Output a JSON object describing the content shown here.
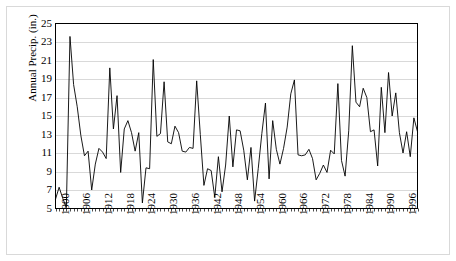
{
  "chart_data": {
    "type": "line",
    "title": "",
    "xlabel": "",
    "ylabel": "Annual Precip. (in.)",
    "ylim": [
      5,
      25
    ],
    "ytick_step": 2,
    "yticks": [
      5,
      7,
      9,
      11,
      13,
      15,
      17,
      19,
      21,
      23,
      25
    ],
    "xlim": [
      1900,
      2000
    ],
    "xticks": [
      1900,
      1906,
      1912,
      1918,
      1924,
      1930,
      1936,
      1942,
      1948,
      1954,
      1960,
      1966,
      1972,
      1978,
      1984,
      1990,
      1996
    ],
    "xtick_labels": [
      "1900",
      "1906",
      "1912",
      "1918",
      "1924",
      "1930",
      "1936",
      "1942",
      "1948",
      "1954",
      "1960",
      "1966",
      "1972",
      "1978",
      "1984",
      "1990",
      "1996"
    ],
    "xtick_rotation": 90,
    "grid": "horizontal",
    "legend": "none",
    "line_color": "#000000",
    "grid_color": "#c8c8c8",
    "axis_color": "#000000",
    "background_color": "#ffffff",
    "x": [
      1900,
      1901,
      1902,
      1903,
      1904,
      1905,
      1906,
      1907,
      1908,
      1909,
      1910,
      1911,
      1912,
      1913,
      1914,
      1915,
      1916,
      1917,
      1918,
      1919,
      1920,
      1921,
      1922,
      1923,
      1924,
      1925,
      1926,
      1927,
      1928,
      1929,
      1930,
      1931,
      1932,
      1933,
      1934,
      1935,
      1936,
      1937,
      1938,
      1939,
      1940,
      1941,
      1942,
      1943,
      1944,
      1945,
      1946,
      1947,
      1948,
      1949,
      1950,
      1951,
      1952,
      1953,
      1954,
      1955,
      1956,
      1957,
      1958,
      1959,
      1960,
      1961,
      1962,
      1963,
      1964,
      1965,
      1966,
      1967,
      1968,
      1969,
      1970,
      1971,
      1972,
      1973,
      1974,
      1975,
      1976,
      1977,
      1978,
      1979,
      1980,
      1981,
      1982,
      1983,
      1984,
      1985,
      1986,
      1987,
      1988,
      1989,
      1990,
      1991,
      1992,
      1993,
      1994,
      1995,
      1996,
      1997,
      1998,
      1999,
      2000
    ],
    "values": [
      6.0,
      7.3,
      6.1,
      5.1,
      23.6,
      18.4,
      16.0,
      12.9,
      10.7,
      11.2,
      7.0,
      9.8,
      11.5,
      11.1,
      10.4,
      20.2,
      13.6,
      17.2,
      8.9,
      13.6,
      14.5,
      13.2,
      11.2,
      13.2,
      5.6,
      9.4,
      9.3,
      21.1,
      12.8,
      13.1,
      18.7,
      12.2,
      12.0,
      13.9,
      13.2,
      11.2,
      11.1,
      11.6,
      11.5,
      18.8,
      13.0,
      7.5,
      9.3,
      9.1,
      6.2,
      10.6,
      6.8,
      9.7,
      15.0,
      9.5,
      13.5,
      13.4,
      11.3,
      8.1,
      11.6,
      5.8,
      9.3,
      13.1,
      16.4,
      8.2,
      14.5,
      11.4,
      9.8,
      11.5,
      13.8,
      17.4,
      18.9,
      10.8,
      10.7,
      10.8,
      11.4,
      10.4,
      8.1,
      8.8,
      9.7,
      8.9,
      11.3,
      10.9,
      18.5,
      10.2,
      8.5,
      13.4,
      22.6,
      16.5,
      16.0,
      18.0,
      17.0,
      13.3,
      13.5,
      9.6,
      18.1,
      13.2,
      19.7,
      15.0,
      17.5,
      13.2,
      11.0,
      13.3,
      10.6,
      14.8,
      13.3
    ]
  }
}
